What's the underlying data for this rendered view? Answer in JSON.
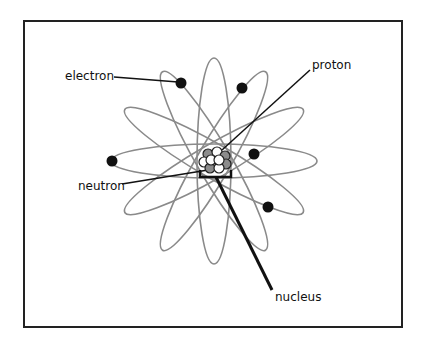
{
  "diagram": {
    "type": "atom-model",
    "labels": {
      "electron": "electron",
      "proton": "proton",
      "neutron": "neutron",
      "nucleus": "nucleus"
    },
    "center": [
      214,
      161
    ],
    "orbits": {
      "count": 6,
      "rotations_deg": [
        0,
        30,
        60,
        90,
        120,
        150
      ],
      "rx": 103,
      "ry": 17,
      "color": "#8a8a8a"
    },
    "electrons": [
      [
        181,
        83
      ],
      [
        242,
        88
      ],
      [
        112,
        161
      ],
      [
        254,
        154
      ],
      [
        268,
        207
      ]
    ],
    "colors": {
      "electron": "#111111",
      "proton": "#8c8c8c",
      "neutron": "#ffffff",
      "frame": "#222222",
      "leader": "#111111"
    }
  }
}
